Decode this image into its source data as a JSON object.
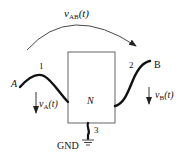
{
  "diagram": {
    "network_label": "N",
    "voltage_ab": {
      "main": "v",
      "sub": "AB",
      "arg": "(t)"
    },
    "voltage_a": {
      "main": "v",
      "sub": "A",
      "arg": "(t)"
    },
    "voltage_b": {
      "main": "v",
      "sub": "B",
      "arg": "(t)"
    },
    "node_a": "A",
    "node_b": "B",
    "terminal_1": "1",
    "terminal_2": "2",
    "terminal_3": "3",
    "ground_label": "GND"
  }
}
